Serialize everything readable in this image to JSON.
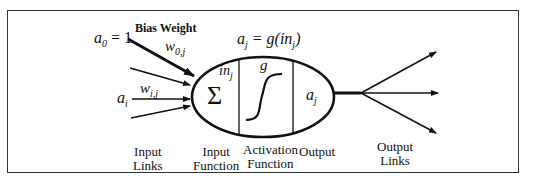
{
  "diagram": {
    "type": "neuron-model",
    "labels": {
      "bias_weight": "Bias Weight",
      "a0_eq": "a",
      "a0_sub": "0",
      "a0_val": " = 1",
      "w0j": "w",
      "w0j_sub": "0,j",
      "wij": "w",
      "wij_sub": "i,j",
      "ai": "a",
      "ai_sub": "i",
      "aj_eq_lhs": "a",
      "aj_eq_sub": "j",
      "aj_eq_rhs": " = g(in",
      "aj_eq_rhs_sub": "j",
      "aj_eq_close": ")",
      "inj": "in",
      "inj_sub": "j",
      "sigma": "Σ",
      "g": "g",
      "aj_out": "a",
      "aj_out_sub": "j"
    },
    "captions": {
      "input_links_1": "Input",
      "input_links_2": "Links",
      "input_function_1": "Input",
      "input_function_2": "Function",
      "activation_function_1": "Activation",
      "activation_function_2": "Function",
      "output": "Output",
      "output_links_1": "Output",
      "output_links_2": "Links"
    }
  }
}
